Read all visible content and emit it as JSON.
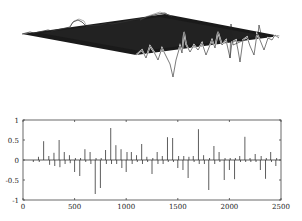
{
  "chart_data": [
    {
      "type": "surface",
      "title": "",
      "description": "3D wireframe/mesh surface viewed obliquely, mostly flat dark plane with spiky oscillations along the front-right edge",
      "axes_visible": false
    },
    {
      "type": "stem",
      "title": "",
      "xlabel": "",
      "ylabel": "",
      "xlim": [
        0,
        2500
      ],
      "ylim": [
        -1,
        1
      ],
      "xticks": [
        "0",
        "500",
        "1000",
        "1500",
        "2000",
        "2500"
      ],
      "yticks": [
        "1",
        "0.5",
        "0",
        "-0.5",
        "-1"
      ],
      "grid": false,
      "x": [
        100,
        150,
        200,
        250,
        300,
        350,
        400,
        450,
        500,
        550,
        600,
        650,
        700,
        750,
        800,
        850,
        900,
        950,
        1000,
        1050,
        1100,
        1150,
        1200,
        1250,
        1300,
        1350,
        1400,
        1450,
        1500,
        1550,
        1600,
        1650,
        1700,
        1750,
        1800,
        1850,
        1900,
        1950,
        2000,
        2050,
        2100,
        2150,
        2200,
        2250,
        2300,
        2350,
        2400,
        2450
      ],
      "values": [
        -0.05,
        0.08,
        0.47,
        0.1,
        0.18,
        0.5,
        0.2,
        0.12,
        -0.3,
        -0.4,
        0.27,
        0.2,
        -0.85,
        -0.7,
        0.25,
        0.8,
        0.37,
        0.27,
        -0.3,
        0.2,
        0.12,
        0.4,
        0.08,
        -0.35,
        0.2,
        0.1,
        0.57,
        0.55,
        -0.2,
        -0.25,
        -0.45,
        0.1,
        0.77,
        0.12,
        -0.75,
        0.35,
        0.2,
        -0.5,
        -0.25,
        -0.48,
        0.1,
        0.58,
        0.05,
        0.15,
        -0.25,
        -0.47,
        0.2,
        -0.15
      ],
      "secondary_values": [
        0,
        -0.05,
        0,
        -0.12,
        -0.15,
        -0.18,
        -0.1,
        -0.08,
        0.05,
        0.05,
        -0.05,
        -0.1,
        0.05,
        0.05,
        -0.1,
        -0.1,
        -0.1,
        -0.2,
        0.2,
        -0.1,
        -0.05,
        -0.1,
        -0.05,
        0.05,
        -0.1,
        -0.1,
        -0.05,
        -0.05,
        0.1,
        0.1,
        0.08,
        -0.05,
        -0.1,
        -0.1,
        0.05,
        -0.1,
        -0.05,
        0.05,
        0.05,
        0.05,
        -0.05,
        -0.05,
        -0.05,
        -0.05,
        0.1,
        0.05,
        -0.05,
        0.05
      ]
    }
  ],
  "axis": {
    "xticks": [
      "0",
      "500",
      "1000",
      "1500",
      "2000",
      "2500"
    ],
    "yticks": [
      "1",
      "0.5",
      "0",
      "-0.5",
      "-1"
    ]
  }
}
